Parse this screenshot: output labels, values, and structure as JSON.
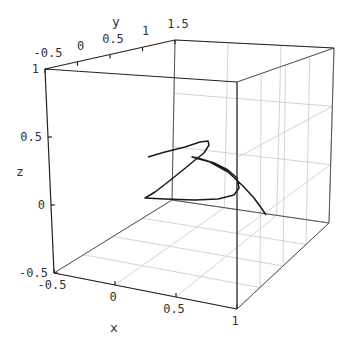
{
  "chart_data": {
    "type": "line",
    "subtype": "3d-parametric-curve",
    "title": "",
    "xlabel": "x",
    "ylabel": "y",
    "zlabel": "z",
    "xlim": [
      -0.5,
      1
    ],
    "ylim": [
      -0.5,
      1.5
    ],
    "zlim": [
      -0.5,
      1
    ],
    "x_ticks": [
      "-0.5",
      "0",
      "0.5",
      "1"
    ],
    "y_ticks": [
      "-0.5",
      "0",
      "0.5",
      "1",
      "1.5"
    ],
    "z_ticks": [
      "-0.5",
      "0",
      "0.5",
      "1"
    ],
    "grid": true,
    "legend": null,
    "series": [
      {
        "name": "curve",
        "color": "#1a1a1a",
        "screen_path": [
          [
            148,
            157
          ],
          [
            165,
            152
          ],
          [
            185,
            147
          ],
          [
            200,
            142
          ],
          [
            208,
            141
          ],
          [
            209,
            145
          ],
          [
            204,
            153
          ],
          [
            195,
            160
          ],
          [
            183,
            170
          ],
          [
            168,
            182
          ],
          [
            155,
            192
          ],
          [
            145,
            198
          ],
          [
            165,
            199
          ],
          [
            195,
            200
          ],
          [
            218,
            199
          ],
          [
            234,
            195
          ],
          [
            239,
            188
          ],
          [
            237,
            178
          ],
          [
            228,
            170
          ],
          [
            214,
            163
          ],
          [
            198,
            158
          ],
          [
            192,
            157
          ],
          [
            210,
            162
          ],
          [
            228,
            172
          ],
          [
            243,
            186
          ],
          [
            254,
            198
          ],
          [
            262,
            209
          ],
          [
            266,
            215
          ]
        ]
      }
    ]
  },
  "colors": {
    "background": "#ffffff",
    "box_edges": "#555555",
    "grid": "#c8c8c8",
    "curve": "#1a1a1a"
  }
}
